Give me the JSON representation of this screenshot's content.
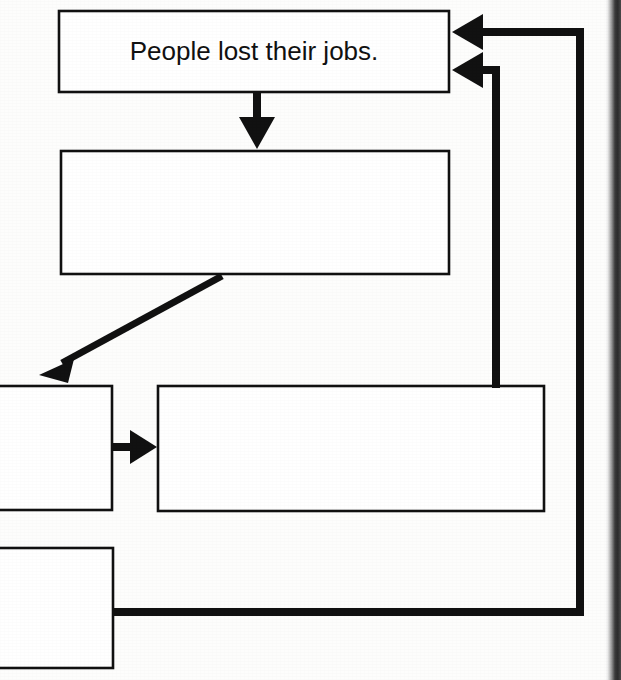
{
  "document": {
    "type": "flowchart",
    "title": "Cause and effect flow chart (partial scan)",
    "background_color": "#fdfdfc",
    "line_color": "#111111",
    "text_color": "#111111"
  },
  "nodes": [
    {
      "id": "node-jobs",
      "name": "people-lost-their-jobs-box",
      "label": "People lost their jobs.",
      "x": 58,
      "y": 10,
      "width": 392,
      "height": 83,
      "stroke_width": 2,
      "clipped": false
    },
    {
      "id": "node-second",
      "name": "second-box",
      "label": "",
      "x": 60,
      "y": 150,
      "width": 390,
      "height": 125,
      "stroke_width": 2,
      "clipped": false
    },
    {
      "id": "node-mid-left",
      "name": "mid-left-box",
      "label": "",
      "x": -60,
      "y": 385,
      "width": 172,
      "height": 126,
      "stroke_width": 2,
      "clipped": true
    },
    {
      "id": "node-large",
      "name": "large-right-box",
      "label": "",
      "x": 157,
      "y": 385,
      "width": 388,
      "height": 127,
      "stroke_width": 2,
      "clipped": false
    },
    {
      "id": "node-bottom-left",
      "name": "bottom-left-box",
      "label": "",
      "x": -60,
      "y": 547,
      "width": 173,
      "height": 121,
      "stroke_width": 2,
      "clipped": true
    }
  ],
  "connectors": [
    {
      "id": "conn-down",
      "name": "arrow-jobs-to-second-box",
      "kind": "arrow",
      "direction": "down",
      "from": "node-jobs",
      "to": "node-second",
      "path": "M 257 93 L 257 127",
      "arrowhead": {
        "tip_x": 257,
        "tip_y": 148,
        "size": 13,
        "direction": "down"
      },
      "stroke_width": 7
    },
    {
      "id": "conn-diagonal",
      "name": "arrow-second-box-to-mid-left-box",
      "kind": "arrow",
      "direction": "down-left",
      "from": "node-second",
      "to": "node-mid-left",
      "path": "M 221 276 L 56 366",
      "arrowhead": {
        "tip_x": 40,
        "tip_y": 374,
        "size": 13,
        "direction": "down-left"
      },
      "stroke_width": 6
    },
    {
      "id": "conn-right",
      "name": "arrow-mid-left-box-to-large-box",
      "kind": "arrow",
      "direction": "right",
      "from": "node-mid-left",
      "to": "node-large",
      "path": "M 112 447 L 136 447",
      "arrowhead": {
        "tip_x": 156,
        "tip_y": 447,
        "size": 13,
        "direction": "right"
      },
      "stroke_width": 7
    },
    {
      "id": "conn-feedback-inner",
      "name": "feedback-arrow-large-box-to-jobs-box",
      "kind": "feedback-arrow",
      "direction": "left",
      "from": "node-large",
      "to": "node-jobs",
      "path": "M 496 385 L 496 70 L 476 70",
      "arrowhead": {
        "tip_x": 453,
        "tip_y": 70,
        "size": 15,
        "direction": "left"
      },
      "stroke_width": 7
    },
    {
      "id": "conn-feedback-outer",
      "name": "feedback-arrow-bottom-left-box-to-jobs-box",
      "kind": "feedback-arrow",
      "direction": "left",
      "from": "node-bottom-left",
      "to": "node-jobs",
      "path": "M 113 612 L 580 612 L 580 32 L 476 32",
      "arrowhead": {
        "tip_x": 453,
        "tip_y": 32,
        "size": 15,
        "direction": "left"
      },
      "stroke_width": 7
    }
  ],
  "artifacts": {
    "scan_edge": {
      "name": "page-scan-edge",
      "x": 605,
      "width": 16,
      "description": "dark vertical scan edge at right side of page"
    }
  }
}
